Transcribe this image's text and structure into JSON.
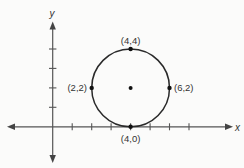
{
  "diagram": {
    "type": "coordinate-plane-circle",
    "axes": {
      "x_label": "x",
      "y_label": "y",
      "x_ticks": [
        1,
        2,
        3,
        4,
        5,
        6,
        7
      ],
      "y_ticks": [
        1,
        2,
        3,
        4
      ]
    },
    "circle": {
      "center": [
        4,
        2
      ],
      "radius": 2
    },
    "points": [
      {
        "label": "(4,4)",
        "x": 4,
        "y": 4
      },
      {
        "label": "(2,2)",
        "x": 2,
        "y": 2
      },
      {
        "label": "(6,2)",
        "x": 6,
        "y": 2
      },
      {
        "label": "(4,0)",
        "x": 4,
        "y": 0
      },
      {
        "label": "",
        "x": 4,
        "y": 2
      }
    ],
    "colors": {
      "background": "#fbfbfa",
      "axis": "#555555",
      "circle": "#2a2a2a",
      "points": "#111111"
    }
  }
}
